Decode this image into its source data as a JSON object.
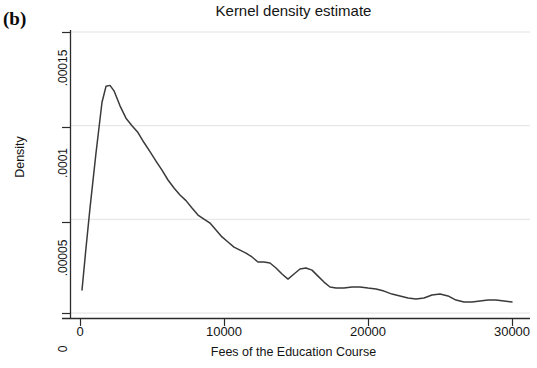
{
  "panel": {
    "label": "(b)"
  },
  "chart_data": {
    "type": "line",
    "title": "Kernel density estimate",
    "xlabel": "Fees of the Education Course",
    "ylabel": "Density",
    "xlim": [
      0,
      30000
    ],
    "ylim": [
      0,
      0.00015
    ],
    "grid": "horizontal",
    "legend": null,
    "xticks": [
      0,
      10000,
      20000,
      30000
    ],
    "xtick_labels": [
      "0",
      "10000",
      "20000",
      "30000"
    ],
    "yticks": [
      0,
      5e-05,
      0.0001,
      0.00015
    ],
    "ytick_labels": [
      "0",
      ".00005",
      ".0001",
      ".00015"
    ],
    "series": [
      {
        "name": "Kernel density",
        "color": "#3a3a3a",
        "x": [
          139,
          417,
          694,
          1111,
          1528,
          1806,
          2083,
          2361,
          2778,
          3194,
          3611,
          4028,
          4444,
          4861,
          5278,
          5694,
          6111,
          6528,
          6944,
          7361,
          7778,
          8194,
          8611,
          9028,
          9444,
          9861,
          10278,
          10694,
          11111,
          11528,
          11944,
          12361,
          12778,
          13194,
          13611,
          14028,
          14444,
          14861,
          15278,
          15694,
          16111,
          16528,
          16944,
          17361,
          17778,
          18333,
          18889,
          19444,
          20000,
          20556,
          21111,
          21667,
          22222,
          22778,
          23333,
          23889,
          24444,
          25000,
          25556,
          26111,
          26667,
          27222,
          27778,
          28333,
          28889,
          29444,
          30000
        ],
        "y": [
          1.23e-05,
          3.47e-05,
          5.6e-05,
          8.54e-05,
          0.0001125,
          0.000121,
          0.0001215,
          0.0001186,
          0.0001106,
          0.000104,
          0.0001,
          9.63e-05,
          9.1e-05,
          8.61e-05,
          8.11e-05,
          7.63e-05,
          7.1e-05,
          6.67e-05,
          6.3e-05,
          6e-05,
          5.6e-05,
          5.23e-05,
          5.01e-05,
          4.8e-05,
          4.43e-05,
          4.06e-05,
          3.79e-05,
          3.52e-05,
          3.36e-05,
          3.2e-05,
          2.99e-05,
          2.72e-05,
          2.72e-05,
          2.67e-05,
          2.4e-05,
          2.08e-05,
          1.81e-05,
          2.08e-05,
          2.35e-05,
          2.4e-05,
          2.29e-05,
          1.97e-05,
          1.65e-05,
          1.39e-05,
          1.33e-05,
          1.33e-05,
          1.39e-05,
          1.39e-05,
          1.33e-05,
          1.28e-05,
          1.17e-05,
          1.01e-05,
          9.1e-06,
          8e-06,
          7.5e-06,
          8e-06,
          9.6e-06,
          1.01e-05,
          9.1e-06,
          6.9e-06,
          5.9e-06,
          5.9e-06,
          6.4e-06,
          6.9e-06,
          6.9e-06,
          6.4e-06,
          5.9e-06
        ]
      }
    ]
  },
  "style": {
    "axis_color": "#2b2b2b",
    "grid_color": "#e2e2e2",
    "line_color": "#3a3a3a",
    "background": "#ffffff"
  }
}
